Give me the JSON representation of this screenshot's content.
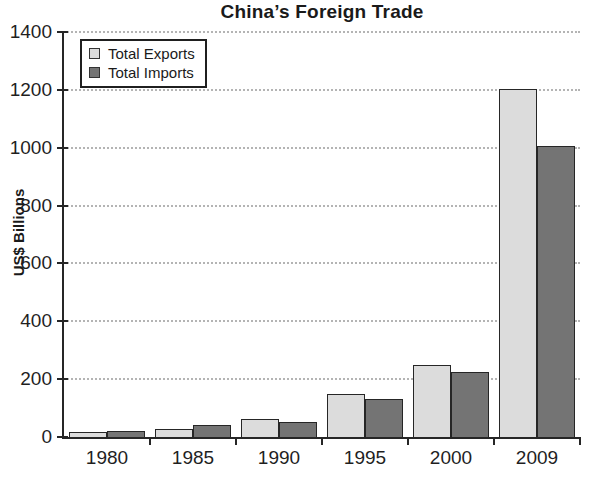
{
  "chart_data": {
    "type": "bar",
    "title": "China’s Foreign Trade",
    "ylabel": "US$ Billions",
    "xlabel": "",
    "categories": [
      "1980",
      "1985",
      "1990",
      "1995",
      "2000",
      "2009"
    ],
    "series": [
      {
        "name": "Total Exports",
        "values": [
          18,
          27,
          62,
          149,
          249,
          1202
        ]
      },
      {
        "name": "Total Imports",
        "values": [
          20,
          42,
          53,
          132,
          225,
          1006
        ]
      }
    ],
    "ylim": [
      0,
      1400
    ],
    "yticks": [
      0,
      200,
      400,
      600,
      800,
      1000,
      1200,
      1400
    ],
    "grid": "horizontal-dotted",
    "legend_position": "top-left"
  },
  "colors": {
    "exports_fill": "#dcdcdc",
    "imports_fill": "#747474",
    "bar_border": "#262626",
    "axis": "#262626",
    "gridline": "#b4b4b4",
    "text": "#1a1a1a",
    "background": "#ffffff"
  }
}
